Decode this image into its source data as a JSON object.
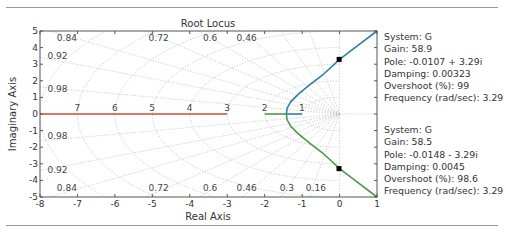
{
  "chart_data": {
    "type": "line",
    "title": "Root Locus",
    "xlabel": "Real Axis",
    "ylabel": "Imaginary Axis",
    "xlim": [
      -8,
      1
    ],
    "ylim": [
      -5,
      5
    ],
    "xticks": [
      "-8",
      "-7",
      "-6",
      "-5",
      "-4",
      "-3",
      "-2",
      "-1",
      "0",
      "1"
    ],
    "yticks": [
      "5",
      "4",
      "3",
      "2",
      "1",
      "0",
      "-1",
      "-2",
      "-3",
      "-4",
      "-5"
    ],
    "xtick_values": [
      -8,
      -7,
      -6,
      -5,
      -4,
      -3,
      -2,
      -1,
      0,
      1
    ],
    "ytick_values": [
      5,
      4,
      3,
      2,
      1,
      0,
      -1,
      -2,
      -3,
      -4,
      -5
    ],
    "grid": true,
    "damping_lines": [
      0.16,
      0.3,
      0.46,
      0.6,
      0.72,
      0.84,
      0.92,
      0.98
    ],
    "damping_labels_top": [
      {
        "text": "0.84",
        "x": -7.55,
        "y": 4.55
      },
      {
        "text": "0.72",
        "x": -5.1,
        "y": 4.55
      },
      {
        "text": "0.6",
        "x": -3.65,
        "y": 4.55
      },
      {
        "text": "0.46",
        "x": -2.75,
        "y": 4.55
      },
      {
        "text": "0.92",
        "x": -7.8,
        "y": 3.5
      },
      {
        "text": "0.98",
        "x": -7.8,
        "y": 1.5
      }
    ],
    "damping_labels_bottom": [
      {
        "text": "0.98",
        "x": -7.8,
        "y": -1.35
      },
      {
        "text": "0.92",
        "x": -7.8,
        "y": -3.35
      },
      {
        "text": "0.84",
        "x": -7.55,
        "y": -4.45
      },
      {
        "text": "0.72",
        "x": -5.1,
        "y": -4.45
      },
      {
        "text": "0.6",
        "x": -3.65,
        "y": -4.45
      },
      {
        "text": "0.46",
        "x": -2.75,
        "y": -4.45
      },
      {
        "text": "0.3",
        "x": -1.6,
        "y": -4.45
      },
      {
        "text": "0.16",
        "x": -0.9,
        "y": -4.45
      }
    ],
    "frequency_labels": [
      {
        "text": "7",
        "x": -7.0
      },
      {
        "text": "6",
        "x": -6.0
      },
      {
        "text": "5",
        "x": -5.0
      },
      {
        "text": "4",
        "x": -4.0
      },
      {
        "text": "3",
        "x": -3.0
      },
      {
        "text": "2",
        "x": -2.0
      },
      {
        "text": "1",
        "x": -1.0
      }
    ],
    "series": [
      {
        "name": "branch-red",
        "color": "#d9472b",
        "points": [
          [
            -8,
            0
          ],
          [
            -3,
            0
          ]
        ]
      },
      {
        "name": "branch-green-real",
        "color": "#4a9a4a",
        "points": [
          [
            -2,
            0
          ],
          [
            -1.42,
            0
          ]
        ]
      },
      {
        "name": "branch-blue-real",
        "color": "#2c7fa8",
        "points": [
          [
            -1.42,
            0
          ],
          [
            -1,
            0
          ]
        ]
      },
      {
        "name": "branch-blue-upper",
        "color": "#2c7fa8",
        "points": [
          [
            -1.42,
            0
          ],
          [
            -1.4,
            0.35
          ],
          [
            -1.3,
            0.75
          ],
          [
            -1.1,
            1.2
          ],
          [
            -0.8,
            1.75
          ],
          [
            -0.45,
            2.35
          ],
          [
            0,
            3.29
          ],
          [
            0.5,
            4.15
          ],
          [
            1,
            5
          ]
        ]
      },
      {
        "name": "branch-green-lower",
        "color": "#4a9a4a",
        "points": [
          [
            -1.42,
            0
          ],
          [
            -1.4,
            -0.35
          ],
          [
            -1.3,
            -0.75
          ],
          [
            -1.1,
            -1.2
          ],
          [
            -0.8,
            -1.75
          ],
          [
            -0.45,
            -2.35
          ],
          [
            0,
            -3.29
          ],
          [
            0.5,
            -4.15
          ],
          [
            1,
            -5
          ]
        ]
      }
    ],
    "markers": [
      {
        "label": "pole-datatip-upper",
        "x": -0.0107,
        "y": 3.29
      },
      {
        "label": "pole-datatip-lower",
        "x": -0.0148,
        "y": -3.29
      }
    ]
  },
  "datatips": [
    {
      "system": "System: G",
      "gain": "Gain: 58.9",
      "pole": "Pole: -0.0107 + 3.29i",
      "damping": "Damping: 0.00323",
      "overshoot": "Overshoot (%): 99",
      "frequency": "Frequency (rad/sec): 3.29"
    },
    {
      "system": "System: G",
      "gain": "Gain: 58.5",
      "pole": "Pole: -0.0148 - 3.29i",
      "damping": "Damping: 0.0045",
      "overshoot": "Overshoot (%): 98.6",
      "frequency": "Frequency (rad/sec): 3.29"
    }
  ]
}
